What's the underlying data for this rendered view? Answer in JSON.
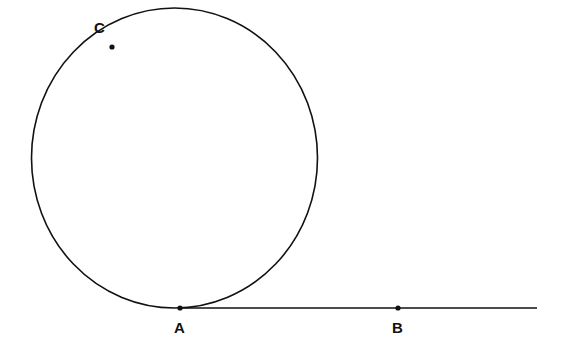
{
  "diagram": {
    "colors": {
      "stroke": "#111111",
      "background": "#ffffff"
    },
    "circle": {
      "cx": 174.5,
      "cy": 158,
      "rx": 143,
      "ry": 150
    },
    "tangent_line": {
      "x1": 180,
      "y1": 308,
      "x2": 537,
      "y2": 308
    },
    "points": [
      {
        "id": "A",
        "label": "A",
        "x": 180,
        "y": 308,
        "label_x": 174,
        "label_y": 333
      },
      {
        "id": "B",
        "label": "B",
        "x": 398,
        "y": 308,
        "label_x": 392,
        "label_y": 333
      },
      {
        "id": "C",
        "label": "C",
        "x": 112,
        "y": 47,
        "label_x": 94,
        "label_y": 33
      }
    ]
  }
}
